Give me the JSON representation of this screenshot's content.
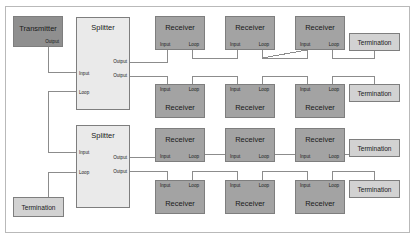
{
  "diagram": {
    "colors": {
      "transmitter_fill": "#8f8f8f",
      "receiver_fill": "#a3a3a3",
      "splitter_fill": "#eaeaea",
      "termination_fill": "#d2d2d2",
      "border": "#7e7e7e",
      "wire": "#8c8c8c",
      "frame": "#b9b9b9",
      "background": "#ffffff"
    },
    "labels": {
      "transmitter": "Transmitter",
      "splitter": "Splitter",
      "receiver": "Receiver",
      "termination": "Termination",
      "port_output": "Output",
      "port_input": "Input",
      "port_loop": "Loop"
    },
    "nodes": {
      "transmitter": {
        "name": "Transmitter",
        "ports": {
          "output": "Output"
        }
      },
      "splitter_top": {
        "name": "Splitter",
        "ports": {
          "output_1": "Output",
          "output_2": "Output",
          "input": "Input",
          "loop": "Loop"
        }
      },
      "splitter_bottom": {
        "name": "Splitter",
        "ports": {
          "input": "Input",
          "loop": "Loop",
          "output_1": "Output",
          "output_2": "Output"
        }
      },
      "receivers_row1": [
        {
          "name": "Receiver",
          "input": "Input",
          "loop": "Loop"
        },
        {
          "name": "Receiver",
          "input": "Input",
          "loop": "Loop"
        },
        {
          "name": "Receiver",
          "input": "Input",
          "loop": "Loop"
        }
      ],
      "receivers_row2": [
        {
          "name": "Receiver",
          "input": "Input",
          "loop": "Loop"
        },
        {
          "name": "Receiver",
          "input": "Input",
          "loop": "Loop"
        },
        {
          "name": "Receiver",
          "input": "Input",
          "loop": "Loop"
        }
      ],
      "receivers_row3": [
        {
          "name": "Receiver",
          "input": "Input",
          "loop": "Loop"
        },
        {
          "name": "Receiver",
          "input": "Input",
          "loop": "Loop"
        },
        {
          "name": "Receiver",
          "input": "Input",
          "loop": "Loop"
        }
      ],
      "receivers_row4": [
        {
          "name": "Receiver",
          "input": "Input",
          "loop": "Loop"
        },
        {
          "name": "Receiver",
          "input": "Input",
          "loop": "Loop"
        },
        {
          "name": "Receiver",
          "input": "Input",
          "loop": "Loop"
        }
      ],
      "terminations": [
        {
          "name": "Termination"
        },
        {
          "name": "Termination"
        },
        {
          "name": "Termination"
        },
        {
          "name": "Termination"
        },
        {
          "name": "Termination"
        }
      ]
    }
  }
}
